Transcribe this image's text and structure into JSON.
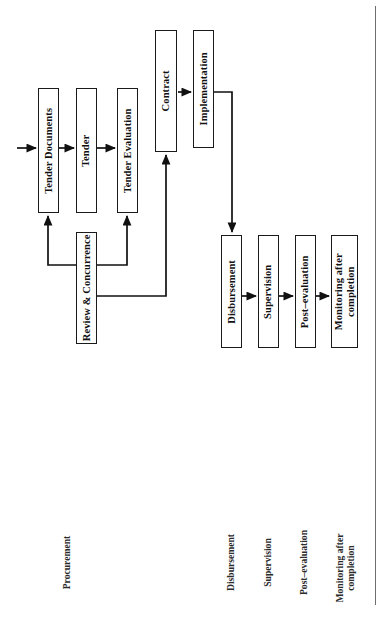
{
  "diagram": {
    "orientation": "rotated-90",
    "ink_color": "#1a1a1a",
    "paper_color": "#ffffff",
    "rule_color": "#6e6e6e"
  },
  "nodes": [
    {
      "id": "tender-documents",
      "label": "Tender Documents",
      "x": 38,
      "y": 88,
      "w": 21,
      "h": 125
    },
    {
      "id": "tender",
      "label": "Tender",
      "x": 76,
      "y": 88,
      "w": 21,
      "h": 125
    },
    {
      "id": "tender-evaluation",
      "label": "Tender Evaluation",
      "x": 117,
      "y": 88,
      "w": 21,
      "h": 125
    },
    {
      "id": "review-concurrence",
      "label": "Review & Concurrence",
      "x": 76,
      "y": 232,
      "w": 21,
      "h": 112
    },
    {
      "id": "contract",
      "label": "Contract",
      "x": 155,
      "y": 30,
      "w": 22,
      "h": 122
    },
    {
      "id": "implementation",
      "label": "Implementation",
      "x": 193,
      "y": 30,
      "w": 21,
      "h": 118
    },
    {
      "id": "disbursement",
      "label": "Disbursement",
      "x": 221,
      "y": 235,
      "w": 21,
      "h": 113
    },
    {
      "id": "supervision",
      "label": "Supervision",
      "x": 258,
      "y": 235,
      "w": 21,
      "h": 113
    },
    {
      "id": "post-evaluation",
      "label": "Post–evaluation",
      "x": 295,
      "y": 235,
      "w": 21,
      "h": 113
    },
    {
      "id": "monitoring-completion",
      "label": "Monitoring after\ncompletion",
      "x": 331,
      "y": 235,
      "w": 27,
      "h": 113
    }
  ],
  "category_labels": [
    {
      "id": "procurement",
      "label": "Procurement",
      "cx": 67,
      "cy": 565
    },
    {
      "id": "disbursement-label",
      "label": "Disbursement",
      "cx": 231,
      "cy": 565
    },
    {
      "id": "supervision-label",
      "label": "Supervision",
      "cx": 268,
      "cy": 565
    },
    {
      "id": "post-evaluation-label",
      "label": "Post–evaluation",
      "cx": 304,
      "cy": 565
    },
    {
      "id": "monitoring-label",
      "label": "Monitoring after\ncompletion",
      "cx": 345,
      "cy": 565
    }
  ],
  "edges": [
    {
      "id": "entry-to-tender-documents",
      "from": "entry",
      "to": "tender-documents",
      "kind": "arrow",
      "path": "M 17,148 L 36,148"
    },
    {
      "id": "tender-documents-to-tender",
      "from": "tender-documents",
      "to": "tender",
      "kind": "arrow",
      "path": "M 59,148 L 74,148"
    },
    {
      "id": "tender-to-evaluation",
      "from": "tender",
      "to": "tender-evaluation",
      "kind": "arrow",
      "path": "M 97,148 L 115,148"
    },
    {
      "id": "review-to-documents",
      "from": "review-concurrence",
      "to": "tender-documents",
      "kind": "arrow",
      "path": "M 76,265 L 48,265 L 48,216"
    },
    {
      "id": "review-to-evaluation",
      "from": "review-concurrence",
      "to": "tender-evaluation",
      "kind": "arrow",
      "path": "M 97,265 L 127,265 L 127,216"
    },
    {
      "id": "review-to-contract",
      "from": "review-concurrence",
      "to": "contract",
      "kind": "arrow",
      "path": "M 97,296 L 166,296 L 166,155"
    },
    {
      "id": "contract-to-implementation",
      "from": "contract",
      "to": "implementation",
      "kind": "arrow",
      "path": "M 178,92 L 191,92"
    },
    {
      "id": "implementation-to-disbursement",
      "from": "implementation",
      "to": "disbursement",
      "kind": "arrow",
      "path": "M 214,92 L 232,92 L 232,232"
    },
    {
      "id": "disbursement-to-supervision",
      "from": "disbursement",
      "to": "supervision",
      "kind": "arrow",
      "path": "M 242,296 L 256,296"
    },
    {
      "id": "supervision-to-post",
      "from": "supervision",
      "to": "post-evaluation",
      "kind": "arrow",
      "path": "M 279,296 L 293,296"
    },
    {
      "id": "post-to-monitoring",
      "from": "post-evaluation",
      "to": "monitoring-completion",
      "kind": "arrow",
      "path": "M 316,296 L 329,296"
    }
  ],
  "rules": [
    {
      "id": "right-margin-rule",
      "x": 375,
      "y": 6,
      "w": 1.2,
      "h": 599
    }
  ]
}
